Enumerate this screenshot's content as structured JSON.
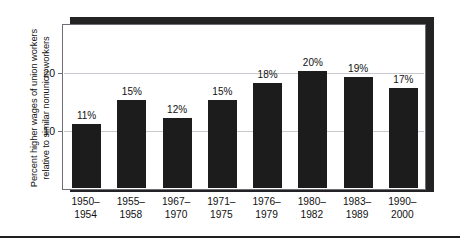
{
  "chart_data": {
    "type": "bar",
    "title": "",
    "subtitle": "",
    "xlabel": "",
    "ylabel_line1": "Percent higher wages of union workers",
    "ylabel_line2": "relative to similar nonunion workers",
    "categories": [
      "1950–1954",
      "1955–1958",
      "1967–1970",
      "1971–1975",
      "1976–1979",
      "1980–1982",
      "1983–1989",
      "1990–2000"
    ],
    "category_lines": [
      [
        "1950–",
        "1954"
      ],
      [
        "1955–",
        "1958"
      ],
      [
        "1967–",
        "1970"
      ],
      [
        "1971–",
        "1975"
      ],
      [
        "1976–",
        "1979"
      ],
      [
        "1980–",
        "1982"
      ],
      [
        "1983–",
        "1989"
      ],
      [
        "1990–",
        "2000"
      ]
    ],
    "values": [
      11,
      15,
      12,
      15,
      18,
      20,
      19,
      17
    ],
    "data_labels": [
      "11%",
      "15%",
      "12%",
      "15%",
      "18%",
      "20%",
      "19%",
      "17%"
    ],
    "ylim": [
      0,
      28
    ],
    "yticks": [
      10,
      20
    ],
    "ytick_labels": [
      "10",
      "20"
    ],
    "grid": true,
    "grid_axis": "y",
    "legend": null,
    "legend_position": "none",
    "bar_color": "#1c1c1c",
    "grid_color": "#c9c9cf",
    "axis_color": "#6e6e76",
    "shadow_color": "#232323",
    "background": "#ffffff"
  }
}
